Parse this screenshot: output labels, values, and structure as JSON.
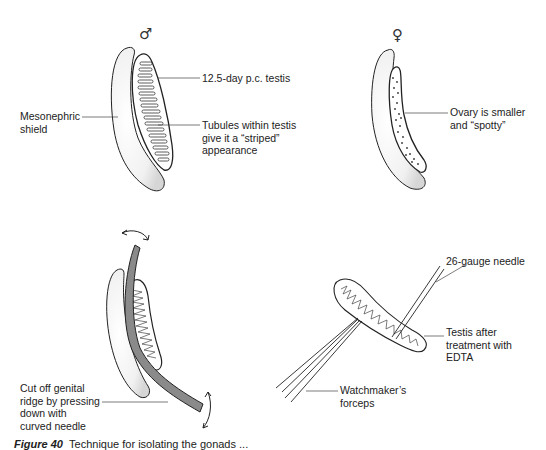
{
  "figure": {
    "panels": [
      {
        "id": "male-gonad",
        "symbol": "♂",
        "labels": {
          "mesonephric": [
            "Mesonephric",
            "shield"
          ],
          "testis": "12.5-day p.c. testis",
          "tubules": [
            "Tubules within testis",
            "give it a “striped”",
            "appearance"
          ]
        }
      },
      {
        "id": "female-gonad",
        "symbol": "♀",
        "labels": {
          "ovary": [
            "Ovary is smaller",
            "and “spotty”"
          ]
        }
      },
      {
        "id": "cut-ridge",
        "labels": {
          "cut": [
            "Cut off genital",
            "ridge by pressing",
            "down with",
            "curved needle"
          ]
        }
      },
      {
        "id": "edta-testis",
        "labels": {
          "needle": "26-gauge needle",
          "testis_edta": [
            "Testis after",
            "treatment with",
            "EDTA"
          ],
          "forceps": [
            "Watchmaker’s",
            "forceps"
          ]
        }
      }
    ],
    "caption": {
      "number": "Figure 40",
      "text": "Technique for isolating the gonads ..."
    },
    "colors": {
      "ink": "#222222",
      "needle_fill": "#8a8a8a",
      "stipple": "#bbbbbb"
    }
  }
}
